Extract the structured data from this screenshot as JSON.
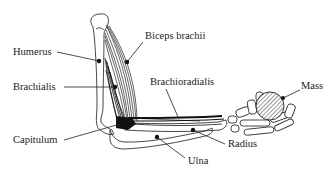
{
  "diagram": {
    "colors": {
      "ink": "#222222",
      "background": "#ffffff",
      "mass_hatch": "#333333"
    },
    "labels": [
      {
        "id": "humerus",
        "text": "Humerus"
      },
      {
        "id": "biceps",
        "text": "Biceps brachii"
      },
      {
        "id": "brachialis",
        "text": "Brachialis"
      },
      {
        "id": "brachioradialis",
        "text": "Brachioradialis"
      },
      {
        "id": "mass",
        "text": "Mass"
      },
      {
        "id": "capitulum",
        "text": "Capitulum"
      },
      {
        "id": "radius",
        "text": "Radius"
      },
      {
        "id": "ulna",
        "text": "Ulna"
      }
    ]
  }
}
